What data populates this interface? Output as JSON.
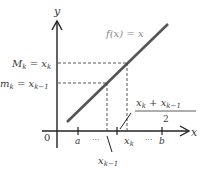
{
  "diagram": {
    "axis_labels": {
      "y": "y",
      "x": "x",
      "origin": "0"
    },
    "function_label": "f(x) = x",
    "upper_label": {
      "main": "M",
      "sub": "k",
      "eq": " = x",
      "eq_sub": "k"
    },
    "lower_label": {
      "main": "m",
      "sub": "k",
      "eq": " = x",
      "eq_sub": "k−1"
    },
    "x_ticks": {
      "a": "a",
      "dots1": "···",
      "xk_minus_1_main": "x",
      "xk_minus_1_sub": "k−1",
      "xk_main": "x",
      "xk_sub": "k",
      "dots2": "···",
      "b": "b"
    },
    "midpoint_label": {
      "num_a": "x",
      "num_a_sub": "k",
      "plus": " + x",
      "num_b_sub": "k−1",
      "den": "2"
    },
    "colors": {
      "line": "#555555",
      "axis": "#222222",
      "dash": "#444444"
    }
  }
}
